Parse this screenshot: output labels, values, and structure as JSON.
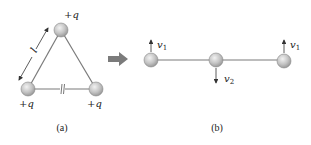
{
  "colors": {
    "line": "#7a7a7a",
    "ball_fill": "#c8c8c8",
    "ball_stroke": "#888888",
    "arrow_big": "#7b7b7b",
    "text": "#222222"
  },
  "panel_a": {
    "caption": "(a)",
    "charges": [
      {
        "label": "+q",
        "position": "top"
      },
      {
        "label": "+q",
        "position": "bottom-left"
      },
      {
        "label": "+q",
        "position": "bottom-right"
      }
    ],
    "side_length_label": "l"
  },
  "panel_b": {
    "caption": "(b)",
    "velocities": [
      {
        "label": "v",
        "sub": "1",
        "direction": "up",
        "position": "left"
      },
      {
        "label": "v",
        "sub": "2",
        "direction": "down",
        "position": "middle"
      },
      {
        "label": "v",
        "sub": "1",
        "direction": "up",
        "position": "right"
      }
    ]
  },
  "transition_arrow": "right"
}
